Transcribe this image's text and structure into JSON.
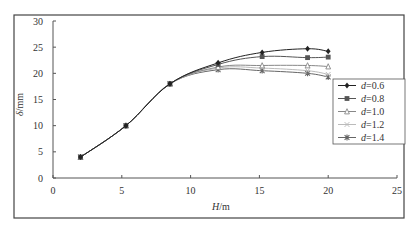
{
  "chart_data": {
    "type": "line",
    "title": "",
    "xlabel": "H/m",
    "xlabel_var": "H",
    "xlabel_unit": "/m",
    "ylabel": "δ/mm",
    "ylabel_var": "δ",
    "ylabel_unit": "/mm",
    "xlim": [
      0,
      25
    ],
    "ylim": [
      0,
      30
    ],
    "xticks": [
      0,
      5,
      10,
      15,
      20,
      25
    ],
    "yticks": [
      0,
      5,
      10,
      15,
      20,
      25,
      30
    ],
    "grid": false,
    "legend_position": "right",
    "series": [
      {
        "name": "d=0.6",
        "var": "d",
        "value": "=0.6",
        "marker": "diamond",
        "color": "#222222",
        "x": [
          2,
          5.3,
          8.5,
          12,
          15.2,
          18.5,
          20
        ],
        "y": [
          4,
          10,
          18,
          22,
          24,
          24.7,
          24.2
        ]
      },
      {
        "name": "d=0.8",
        "var": "d",
        "value": "=0.8",
        "marker": "square",
        "color": "#555555",
        "x": [
          2,
          5.3,
          8.5,
          12,
          15.2,
          18.5,
          20
        ],
        "y": [
          4,
          10,
          18,
          21.7,
          23.2,
          23,
          23.1
        ]
      },
      {
        "name": "d=1.0",
        "var": "d",
        "value": "=1.0",
        "marker": "triangle-open",
        "color": "#888888",
        "x": [
          2,
          5.3,
          8.5,
          12,
          15.2,
          18.5,
          20
        ],
        "y": [
          4,
          10,
          18,
          21.2,
          21.5,
          21.5,
          21.3
        ]
      },
      {
        "name": "d=1.2",
        "var": "d",
        "value": "=1.2",
        "marker": "cross",
        "color": "#bbbbbb",
        "x": [
          2,
          5.3,
          8.5,
          12,
          15.2,
          18.5,
          20
        ],
        "y": [
          4,
          10,
          18,
          21,
          21,
          20.5,
          19.8
        ]
      },
      {
        "name": "d=1.4",
        "var": "d",
        "value": "=1.4",
        "marker": "star",
        "color": "#666666",
        "x": [
          2,
          5.3,
          8.5,
          12,
          15.2,
          18.5,
          20
        ],
        "y": [
          4,
          10,
          18,
          20.7,
          20.5,
          20,
          19.3
        ]
      }
    ]
  },
  "layout": {
    "frame": {
      "x": 14,
      "y": 15,
      "w": 390,
      "h": 203
    },
    "plot": {
      "x0": 53,
      "x1": 397,
      "y0": 178,
      "y1": 21
    },
    "legend": {
      "x": 333,
      "y": 79,
      "w": 72,
      "h": 65
    }
  }
}
